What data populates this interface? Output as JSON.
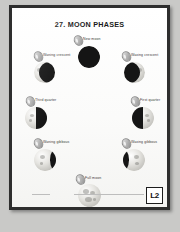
{
  "page": {
    "title": "27. MOON PHASES",
    "badge": "L2"
  },
  "diagram": {
    "type": "moon-phase-cycle",
    "phases": [
      {
        "id": "new-moon",
        "label": "New moon",
        "illumination": 0,
        "position": "top"
      },
      {
        "id": "waxing-crescent",
        "label": "Waxing crescent",
        "illumination": 25,
        "position": "upper-right"
      },
      {
        "id": "first-quarter",
        "label": "First quarter",
        "illumination": 50,
        "position": "right"
      },
      {
        "id": "waxing-gibbous",
        "label": "Waxing gibbous",
        "illumination": 75,
        "position": "lower-right"
      },
      {
        "id": "full-moon",
        "label": "Full moon",
        "illumination": 100,
        "position": "bottom"
      },
      {
        "id": "waning-gibbous",
        "label": "Waning gibbous",
        "illumination": 75,
        "position": "lower-left"
      },
      {
        "id": "third-quarter",
        "label": "Third quarter",
        "illumination": 50,
        "position": "left"
      },
      {
        "id": "waning-crescent",
        "label": "Waning crescent",
        "illumination": 25,
        "position": "upper-left"
      }
    ]
  },
  "footer": {
    "left_text": "",
    "center_text": ""
  }
}
